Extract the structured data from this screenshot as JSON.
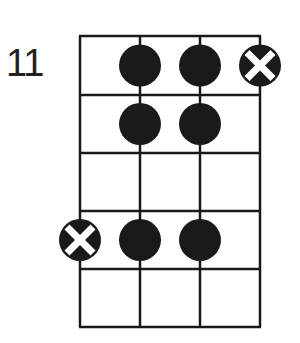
{
  "diagram": {
    "type": "fretboard-chord-diagram",
    "start_fret_label": "11",
    "strings": 4,
    "frets": 5,
    "colors": {
      "line": "#1a1a1a",
      "dot": "#1a1a1a",
      "x_mark": "#ffffff",
      "background": "#ffffff"
    },
    "markers": [
      {
        "fret": 1,
        "string": 2,
        "type": "dot"
      },
      {
        "fret": 1,
        "string": 3,
        "type": "dot"
      },
      {
        "fret": 1,
        "string": 4,
        "type": "x-dot"
      },
      {
        "fret": 2,
        "string": 2,
        "type": "dot"
      },
      {
        "fret": 2,
        "string": 3,
        "type": "dot"
      },
      {
        "fret": 4,
        "string": 1,
        "type": "x-dot"
      },
      {
        "fret": 4,
        "string": 2,
        "type": "dot"
      },
      {
        "fret": 4,
        "string": 3,
        "type": "dot"
      }
    ]
  }
}
